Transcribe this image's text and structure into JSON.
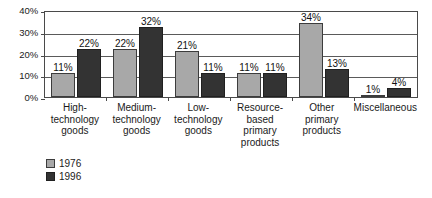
{
  "chart_data": {
    "type": "bar",
    "title": "",
    "subtitle": "",
    "xlabel": "",
    "ylabel": "",
    "ylim": [
      0,
      40
    ],
    "yticks": [
      "0%",
      "10%",
      "20%",
      "30%",
      "40%"
    ],
    "ytick_values": [
      0,
      10,
      20,
      30,
      40
    ],
    "grid": true,
    "legend_position": "bottom-left",
    "categories": [
      "High-technology goods",
      "Medium-technology goods",
      "Low-technology goods",
      "Resource-based primary products",
      "Other primary products",
      "Miscellaneous"
    ],
    "category_lines": [
      [
        "High-",
        "technology",
        "goods"
      ],
      [
        "Medium-",
        "technology",
        "goods"
      ],
      [
        "Low-",
        "technology",
        "goods"
      ],
      [
        "Resource-",
        "based",
        "primary",
        "products"
      ],
      [
        "Other",
        "primary",
        "products"
      ],
      [
        "Miscellaneous"
      ]
    ],
    "series": [
      {
        "name": "1976",
        "color": "#a8a8a8",
        "values": [
          11,
          22,
          21,
          11,
          34,
          1
        ],
        "labels": [
          "11%",
          "22%",
          "21%",
          "11%",
          "34%",
          "1%"
        ]
      },
      {
        "name": "1996",
        "color": "#333333",
        "values": [
          22,
          32,
          11,
          11,
          13,
          4
        ],
        "labels": [
          "22%",
          "32%",
          "11%",
          "11%",
          "13%",
          "4%"
        ]
      }
    ]
  },
  "legend": {
    "items": [
      {
        "label": "1976",
        "color": "#a8a8a8"
      },
      {
        "label": "1996",
        "color": "#333333"
      }
    ]
  }
}
